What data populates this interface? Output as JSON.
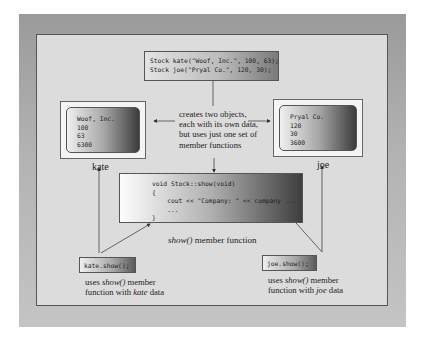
{
  "declaration": {
    "line1": "Stock kate(\"Woof, Inc.\", 100, 63);",
    "line2": "Stock joe(\"Pryal Co.\", 120, 30);"
  },
  "objects": [
    {
      "name": "kate",
      "lines": [
        "Woof, Inc.",
        "100",
        "63",
        "6300"
      ]
    },
    {
      "name": "joe",
      "lines": [
        "Pryal Co.",
        "120",
        "30",
        "3600"
      ]
    }
  ],
  "center_note": "creates two objects, each with its own data, but uses just one set of member functions",
  "member_function": {
    "code": [
      "void Stock::show(void)",
      "{",
      "    cout << \"Company: \" << company ...",
      "    ...",
      "}"
    ],
    "caption_italic": "show()",
    "caption_rest": " member function"
  },
  "calls": [
    {
      "code": "kate.show();",
      "cap_a": "uses ",
      "cap_fn": "show()",
      "cap_b": " member",
      "cap_c": "function with ",
      "cap_obj": "kate",
      "cap_d": " data"
    },
    {
      "code": "joe.show();",
      "cap_a": "uses ",
      "cap_fn": "show()",
      "cap_b": " member",
      "cap_c": "function with ",
      "cap_obj": "joe",
      "cap_d": " data"
    }
  ],
  "colors": {
    "frame": "#a8a8a8",
    "panel": "#dcdcdc",
    "border": "#555555"
  }
}
